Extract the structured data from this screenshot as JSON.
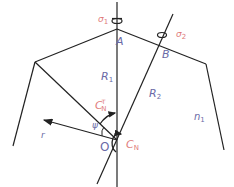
{
  "diagram": {
    "labels": {
      "sigma1": {
        "main": "σ",
        "sub": "1"
      },
      "sigma2": {
        "main": "σ",
        "sub": "2"
      },
      "A": "A",
      "B": "B",
      "R1": {
        "main": "R",
        "sub": "1"
      },
      "R2": {
        "main": "R",
        "sub": "2"
      },
      "CN_T": {
        "main": "C",
        "sub": "N",
        "sup": "T"
      },
      "CN": {
        "main": "C",
        "sub": "N"
      },
      "psi": "ψ",
      "O": "O",
      "r": "r",
      "n1": {
        "main": "n",
        "sub": "1"
      }
    },
    "colors": {
      "line": "#222222",
      "label_blue": "#6a6aa6",
      "label_red": "#e07a7a"
    }
  }
}
